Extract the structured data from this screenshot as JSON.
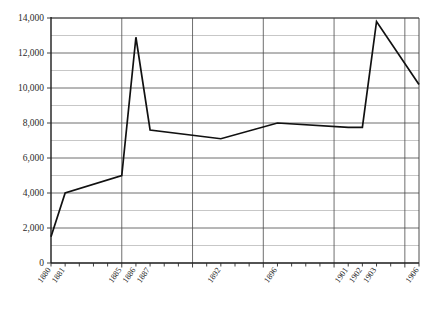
{
  "chart_data": {
    "type": "line",
    "title": "",
    "subtitle": "",
    "xlabel": "",
    "ylabel": "",
    "grid": true,
    "legend": "none",
    "xlim": [
      1880,
      1906
    ],
    "ylim": [
      0,
      14000
    ],
    "y_major_step": 2000,
    "y_minor_step": 1000,
    "y_tick_labels": [
      "0",
      "2,000",
      "4,000",
      "6,000",
      "8,000",
      "10,000",
      "12,000",
      "14,000"
    ],
    "y_tick_values": [
      0,
      2000,
      4000,
      6000,
      8000,
      10000,
      12000,
      14000
    ],
    "x_tick_labels": [
      "1880",
      "1881",
      "1885",
      "1886",
      "1887",
      "1892",
      "1896",
      "1901",
      "1902",
      "1903",
      "1906"
    ],
    "x_major_gridline_years": [
      1885,
      1890,
      1895,
      1900,
      1905
    ],
    "x": [
      1880,
      1881,
      1885,
      1886,
      1887,
      1892,
      1896,
      1901,
      1902,
      1903,
      1906
    ],
    "values": [
      1500,
      4000,
      5000,
      12900,
      7600,
      7100,
      8000,
      7750,
      7750,
      13800,
      10200
    ],
    "series": [
      {
        "name": "series-1",
        "color": "#111111",
        "x": [
          1880,
          1881,
          1885,
          1886,
          1887,
          1892,
          1896,
          1901,
          1902,
          1903,
          1906
        ],
        "values": [
          1500,
          4000,
          5000,
          12900,
          7600,
          7100,
          8000,
          7750,
          7750,
          13800,
          10200
        ]
      }
    ],
    "points": [
      {
        "x": 1880,
        "y": 1500
      },
      {
        "x": 1881,
        "y": 4000
      },
      {
        "x": 1885,
        "y": 5000
      },
      {
        "x": 1886,
        "y": 12900
      },
      {
        "x": 1887,
        "y": 7600
      },
      {
        "x": 1892,
        "y": 7100
      },
      {
        "x": 1896,
        "y": 8000
      },
      {
        "x": 1901,
        "y": 7750
      },
      {
        "x": 1902,
        "y": 7750
      },
      {
        "x": 1903,
        "y": 13800
      },
      {
        "x": 1906,
        "y": 10200
      }
    ]
  }
}
